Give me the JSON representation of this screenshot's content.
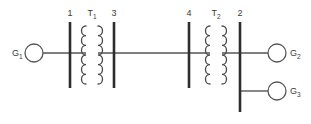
{
  "diagram": {
    "background_color": "#ffffff",
    "line_color": "#555555",
    "bus_color": "#2e2e2e",
    "coil_color": "#4a4a4a",
    "text_color": "#3a3a3a",
    "generators": [
      {
        "id": "g1",
        "base": "G",
        "subscript": "1",
        "label": "G1",
        "cx": 34,
        "cy": 53,
        "r": 9,
        "label_x": 12,
        "label_y": 56,
        "label_anchor": "start"
      },
      {
        "id": "g2",
        "base": "G",
        "subscript": "2",
        "label": "G2",
        "cx": 277,
        "cy": 53,
        "r": 9,
        "label_x": 290,
        "label_y": 56,
        "label_anchor": "start"
      },
      {
        "id": "g3",
        "base": "G",
        "subscript": "3",
        "label": "G3",
        "cx": 277,
        "cy": 91,
        "r": 9,
        "label_x": 290,
        "label_y": 94,
        "label_anchor": "start"
      }
    ],
    "buses": [
      {
        "id": "bus1",
        "label": "1",
        "x": 70,
        "y_top": 22,
        "y_bottom": 88,
        "label_x": 70,
        "label_y": 16
      },
      {
        "id": "bus3",
        "label": "3",
        "x": 114,
        "y_top": 22,
        "y_bottom": 88,
        "label_x": 114,
        "label_y": 16
      },
      {
        "id": "bus4",
        "label": "4",
        "x": 189,
        "y_top": 22,
        "y_bottom": 88,
        "label_x": 189,
        "label_y": 16
      },
      {
        "id": "bus2",
        "label": "2",
        "x": 240,
        "y_top": 22,
        "y_bottom": 112,
        "label_x": 240,
        "label_y": 16
      }
    ],
    "transformers": [
      {
        "id": "t1",
        "base": "T",
        "subscript": "1",
        "label": "T1",
        "left_coil_x": 86,
        "right_coil_x": 98,
        "y_top": 26,
        "y_bottom": 84,
        "loops": 6,
        "bump": 6,
        "label_x": 92,
        "label_y": 16
      },
      {
        "id": "t2",
        "base": "T",
        "subscript": "2",
        "label": "T2",
        "left_coil_x": 210,
        "right_coil_x": 222,
        "y_top": 26,
        "y_bottom": 84,
        "loops": 6,
        "bump": 6,
        "label_x": 216,
        "label_y": 16
      }
    ],
    "wires": [
      {
        "id": "g1-to-bus1",
        "x1": 43,
        "y1": 53,
        "x2": 86,
        "y2": 53
      },
      {
        "id": "t1-to-bus4",
        "x1": 98,
        "y1": 53,
        "x2": 210,
        "y2": 53
      },
      {
        "id": "t2-to-g2",
        "x1": 222,
        "y1": 53,
        "x2": 268,
        "y2": 53
      },
      {
        "id": "bus2-to-g3",
        "x1": 240,
        "y1": 91,
        "x2": 268,
        "y2": 91
      }
    ]
  }
}
